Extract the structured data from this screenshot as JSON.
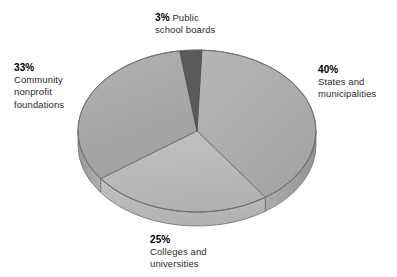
{
  "chart_data": {
    "type": "pie",
    "title": "",
    "subtitle": "",
    "xlabel": "",
    "ylabel": "",
    "grid": false,
    "legend_position": "none",
    "three_d": true,
    "categories": [
      "Public school boards",
      "States and municipalities",
      "Colleges and universities",
      "Community nonprofit foundations"
    ],
    "values": [
      3,
      40,
      25,
      33
    ],
    "value_labels": [
      "3%",
      "40%",
      "25%",
      "33%"
    ],
    "colors": [
      "#5a5a5a",
      "#a6a6a6",
      "#b9b9b9",
      "#adadad"
    ],
    "side_colors": [
      "#494949",
      "#8f8f8f",
      "#a4a4a4",
      "#979797"
    ],
    "slices": [
      {
        "id": "public-school-boards",
        "percent": "3%",
        "name": "Public school boards",
        "value": 3,
        "color": "#5a5a5a",
        "side_color": "#494949",
        "label_position": "top"
      },
      {
        "id": "states-municipalities",
        "percent": "40%",
        "name": "States and municipalities",
        "value": 40,
        "color": "#a6a6a6",
        "side_color": "#8f8f8f",
        "label_position": "right"
      },
      {
        "id": "colleges-universities",
        "percent": "25%",
        "name": "Colleges and universities",
        "value": 25,
        "color": "#b9b9b9",
        "side_color": "#a4a4a4",
        "label_position": "bottom"
      },
      {
        "id": "community-foundations",
        "percent": "33%",
        "name": "Community nonprofit foundations",
        "value": 33,
        "color": "#adadad",
        "side_color": "#979797",
        "label_position": "left"
      }
    ]
  },
  "labels": {
    "public_school_boards": {
      "percent": "3%",
      "line1": "Public",
      "line2": "school boards"
    },
    "states_municipalities": {
      "percent": "40%",
      "line1": "States and",
      "line2": "municipalities"
    },
    "community_foundations": {
      "percent": "33%",
      "line1": "Community",
      "line2": "nonprofit",
      "line3": "foundations"
    },
    "colleges_universities": {
      "percent": "25%",
      "line1": "Colleges and",
      "line2": "universities"
    }
  },
  "style": {
    "background": "#ffffff",
    "outline": "#6f6f6f",
    "text": "#1b1b1b"
  }
}
